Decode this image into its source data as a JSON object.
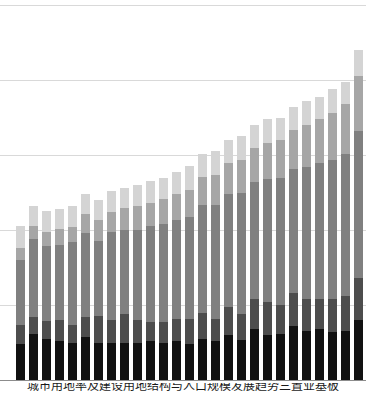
{
  "caption": "城市用地率及建设用地结构与人口规模发展趋势三置业基板",
  "colors": {
    "background": "#ffffff",
    "gridline": "#d9d9d9",
    "axis": "#8c8c8c",
    "series": [
      "#111111",
      "#4d4d4d",
      "#808080",
      "#a6a6a6",
      "#d4d4d4"
    ]
  },
  "chart_data": {
    "type": "bar",
    "title": "",
    "subtitle": "",
    "xlabel": "",
    "ylabel": "",
    "stacked": true,
    "grid": true,
    "legend": "none",
    "ylim": [
      0,
      500
    ],
    "yticks": [
      0,
      100,
      200,
      300,
      400,
      500
    ],
    "categories": [
      "1",
      "2",
      "3",
      "4",
      "5",
      "6",
      "7",
      "8",
      "9",
      "10",
      "11",
      "12",
      "13",
      "14",
      "15",
      "16",
      "17",
      "18",
      "19",
      "20",
      "21",
      "22",
      "23",
      "24",
      "25",
      "26",
      "27"
    ],
    "series": [
      {
        "name": "Series 1",
        "color": "#111111",
        "values": [
          48,
          62,
          55,
          52,
          50,
          58,
          50,
          50,
          50,
          50,
          52,
          50,
          52,
          48,
          55,
          52,
          60,
          54,
          68,
          60,
          62,
          72,
          66,
          68,
          64,
          66,
          80
        ]
      },
      {
        "name": "Series 2",
        "color": "#4d4d4d",
        "values": [
          26,
          22,
          24,
          28,
          24,
          26,
          36,
          30,
          38,
          30,
          26,
          28,
          30,
          34,
          34,
          30,
          38,
          34,
          40,
          44,
          38,
          44,
          42,
          40,
          44,
          46,
          56
        ]
      },
      {
        "name": "Series 3",
        "color": "#808080",
        "values": [
          86,
          104,
          100,
          100,
          110,
          112,
          100,
          118,
          112,
          120,
          128,
          130,
          132,
          136,
          144,
          152,
          150,
          162,
          156,
          164,
          170,
          166,
          176,
          182,
          186,
          190,
          196
        ]
      },
      {
        "name": "Series 4",
        "color": "#a6a6a6",
        "values": [
          16,
          18,
          18,
          22,
          20,
          26,
          28,
          26,
          30,
          32,
          30,
          34,
          34,
          36,
          38,
          40,
          42,
          44,
          46,
          48,
          50,
          52,
          56,
          58,
          62,
          66,
          74
        ]
      },
      {
        "name": "Series 5",
        "color": "#d4d4d4",
        "values": [
          30,
          26,
          28,
          26,
          28,
          26,
          26,
          28,
          26,
          28,
          30,
          28,
          30,
          32,
          30,
          32,
          30,
          32,
          30,
          32,
          30,
          30,
          32,
          30,
          32,
          30,
          34
        ]
      }
    ]
  }
}
